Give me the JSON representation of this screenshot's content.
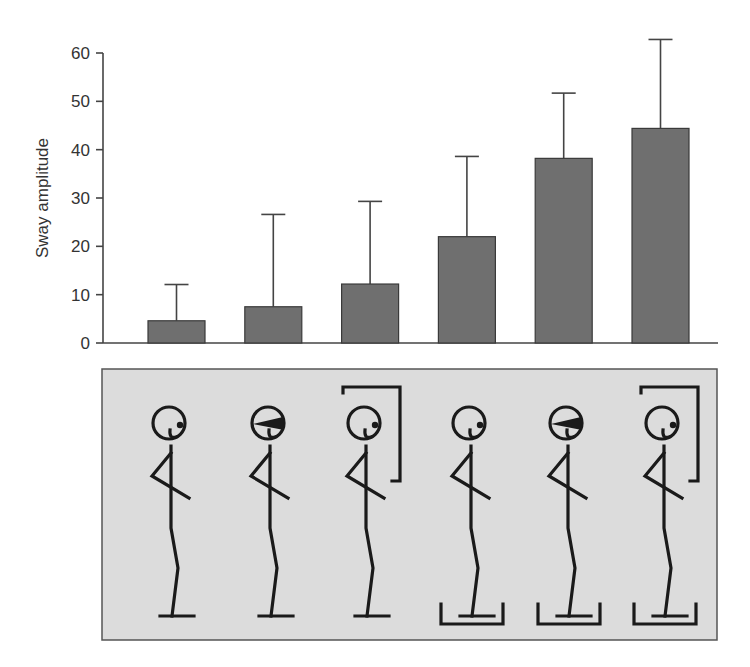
{
  "chart_data": {
    "type": "bar",
    "title": "",
    "xlabel": "",
    "ylabel": "Sway amplitude",
    "ylim": [
      0,
      60
    ],
    "yticks": [
      0,
      10,
      20,
      30,
      40,
      50,
      60
    ],
    "grid": false,
    "legend": null,
    "categories": [
      "Eyes open, firm surface",
      "Eyes closed, firm surface",
      "Sway-referenced vision, firm surface",
      "Eyes open, sway-referenced surface",
      "Eyes closed, sway-referenced surface",
      "Sway-referenced vision, sway-referenced surface"
    ],
    "values": [
      4.6,
      7.5,
      12.2,
      22.0,
      38.2,
      44.4
    ],
    "error_upper": [
      12.1,
      26.6,
      29.3,
      38.6,
      51.7,
      62.8
    ],
    "bar_color": "#6f6f6f"
  },
  "conditions_panel": {
    "background": "#dcdcdc",
    "figures": [
      {
        "blindfold": false,
        "visual_surround": false,
        "platform_cup": false
      },
      {
        "blindfold": true,
        "visual_surround": false,
        "platform_cup": false
      },
      {
        "blindfold": false,
        "visual_surround": true,
        "platform_cup": false
      },
      {
        "blindfold": false,
        "visual_surround": false,
        "platform_cup": true
      },
      {
        "blindfold": true,
        "visual_surround": false,
        "platform_cup": true
      },
      {
        "blindfold": false,
        "visual_surround": true,
        "platform_cup": true
      }
    ]
  }
}
